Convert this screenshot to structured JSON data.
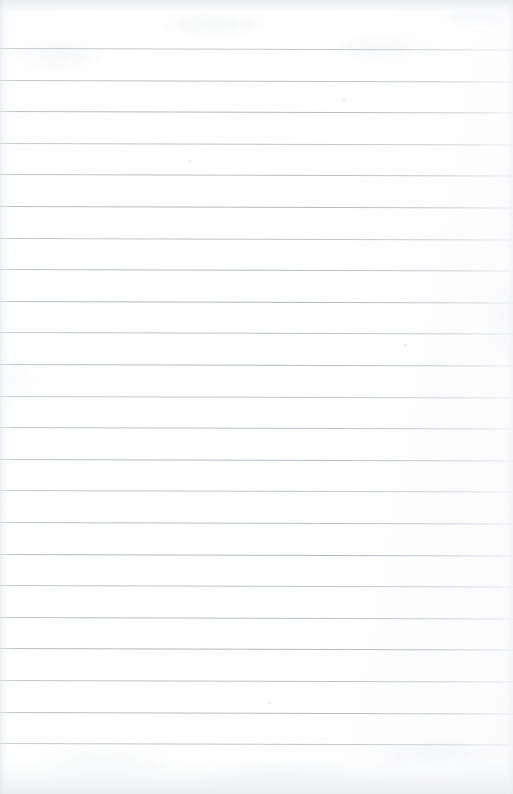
{
  "document": {
    "kind": "scanned-lined-notebook-paper",
    "title": "Blank lined notebook page",
    "content_text": "",
    "page_width": 513,
    "page_height": 794,
    "background_color": "#ffffff",
    "paper_tint": "#fdfdfe"
  },
  "ruling": {
    "line_color": "#b4b8c0",
    "line_thickness_px": 1,
    "line_spacing_px": 31.6,
    "first_line_y_px": 48,
    "line_count": 23,
    "left_inset_px": 0,
    "right_inset_px": 0,
    "skew_deg": 0.16,
    "line_y_positions": [
      48,
      79.6,
      111.2,
      142.8,
      174.4,
      206,
      237.6,
      269.2,
      300.8,
      332.4,
      364,
      395.6,
      427.2,
      458.8,
      490.4,
      522,
      553.6,
      585.2,
      616.8,
      648.4,
      680,
      711.6,
      743.2
    ]
  },
  "edges": {
    "top_band_color": "#e9ebee",
    "top_band_height_px": 14,
    "bottom_band_color": "#eaecef",
    "bottom_band_height_px": 40,
    "left_gutter_color": "#e2e4e8",
    "right_edge_color": "#e9ebee"
  },
  "artifacts": {
    "smudges": [
      {
        "name": "line-smudge",
        "x": 172,
        "y": 266,
        "width": 40,
        "height": 3
      }
    ],
    "specks": [
      {
        "x": 343,
        "y": 99,
        "size": 2
      },
      {
        "x": 189,
        "y": 160,
        "size": 2
      },
      {
        "x": 113,
        "y": 130,
        "size": 1
      },
      {
        "x": 404,
        "y": 344,
        "size": 2
      },
      {
        "x": 223,
        "y": 490,
        "size": 2
      },
      {
        "x": 308,
        "y": 652,
        "size": 1
      },
      {
        "x": 457,
        "y": 556,
        "size": 2
      },
      {
        "x": 76,
        "y": 612,
        "size": 1
      },
      {
        "x": 268,
        "y": 702,
        "size": 2
      }
    ]
  }
}
